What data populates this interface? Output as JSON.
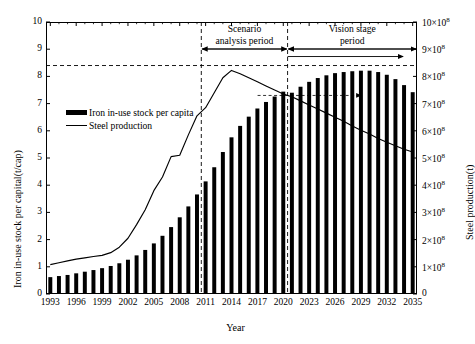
{
  "chart_data": {
    "type": "bar",
    "title": "",
    "xlabel": "Year",
    "ylabel": "Iron in-use stock per capital(t/cap)",
    "ylabel_right": "Steel production(t)",
    "grid": false,
    "legend_position": "upper-left-inside",
    "xlim": [
      1993,
      2035
    ],
    "ylim": [
      0,
      10
    ],
    "ylim_right": [
      0,
      1000000000
    ],
    "x_tick_labels": [
      "1993",
      "1996",
      "1999",
      "2002",
      "2005",
      "2008",
      "2011",
      "2014",
      "2017",
      "2020",
      "2023",
      "2026",
      "2029",
      "2032",
      "2035"
    ],
    "x_tick_values": [
      1993,
      1996,
      1999,
      2002,
      2005,
      2008,
      2011,
      2014,
      2017,
      2020,
      2023,
      2026,
      2029,
      2032,
      2035
    ],
    "y_tick_labels_left": [
      "0",
      "1",
      "2",
      "3",
      "4",
      "5",
      "6",
      "7",
      "8",
      "9",
      "10"
    ],
    "y_tick_values_left": [
      0,
      1,
      2,
      3,
      4,
      5,
      6,
      7,
      8,
      9,
      10
    ],
    "y_tick_labels_right": [
      "0",
      "1×10",
      "2×10",
      "3×10",
      "4×10",
      "5×10",
      "6×10",
      "7×10",
      "8×10",
      "9×10",
      "10×10"
    ],
    "y_tick_right_exponent": "8",
    "y_tick_values_right": [
      0,
      1,
      2,
      3,
      4,
      5,
      6,
      7,
      8,
      9,
      10
    ],
    "categories": [
      1993,
      1994,
      1995,
      1996,
      1997,
      1998,
      1999,
      2000,
      2001,
      2002,
      2003,
      2004,
      2005,
      2006,
      2007,
      2008,
      2009,
      2010,
      2011,
      2012,
      2013,
      2014,
      2015,
      2016,
      2017,
      2018,
      2019,
      2020,
      2021,
      2022,
      2023,
      2024,
      2025,
      2026,
      2027,
      2028,
      2029,
      2030,
      2031,
      2032,
      2033,
      2034,
      2035
    ],
    "series": [
      {
        "name": "Iron in-use stock per capita",
        "kind": "bar",
        "axis": "left",
        "color": "#000000",
        "values": [
          0.62,
          0.66,
          0.7,
          0.76,
          0.82,
          0.88,
          0.95,
          1.03,
          1.13,
          1.26,
          1.42,
          1.62,
          1.86,
          2.14,
          2.46,
          2.82,
          3.22,
          3.66,
          4.14,
          4.66,
          5.22,
          5.76,
          6.18,
          6.52,
          6.82,
          7.06,
          7.26,
          7.44,
          7.4,
          7.62,
          7.8,
          7.94,
          8.04,
          8.12,
          8.16,
          8.19,
          8.21,
          8.21,
          8.16,
          8.06,
          7.9,
          7.68,
          7.42
        ]
      },
      {
        "name": "Steel production",
        "kind": "line",
        "axis": "right",
        "color": "#000000",
        "values": [
          1.08,
          1.15,
          1.22,
          1.28,
          1.33,
          1.38,
          1.42,
          1.52,
          1.72,
          2.05,
          2.55,
          3.1,
          3.8,
          4.3,
          5.05,
          5.1,
          5.85,
          6.55,
          6.85,
          7.4,
          7.95,
          8.22,
          8.1,
          7.95,
          7.8,
          7.65,
          7.5,
          7.35,
          7.25,
          7.1,
          6.95,
          6.8,
          6.65,
          6.5,
          6.35,
          6.18,
          6.02,
          5.88,
          5.72,
          5.58,
          5.45,
          5.32,
          5.22
        ]
      }
    ],
    "reference_lines": [
      {
        "name": "peak-stock-hline",
        "orient": "horizontal",
        "axis": "left",
        "value": 8.4,
        "style": "dashed"
      },
      {
        "name": "scenario-start-vline",
        "orient": "vertical",
        "value": 2011,
        "style": "dashed"
      },
      {
        "name": "vision-start-vline",
        "orient": "vertical",
        "value": 2021,
        "style": "dashed"
      },
      {
        "name": "saturation-arrow",
        "orient": "horizontal",
        "axis": "left",
        "value": 7.3,
        "style": "dashed-arrow"
      }
    ],
    "annotations": [
      {
        "name": "scenario-analysis-period",
        "line1": "Scenario",
        "line2": "analysis period",
        "span": [
          2011,
          2021
        ]
      },
      {
        "name": "vision-stage-period",
        "line1": "Vision stage",
        "line2": "period",
        "span": [
          2021,
          2035
        ]
      }
    ]
  }
}
